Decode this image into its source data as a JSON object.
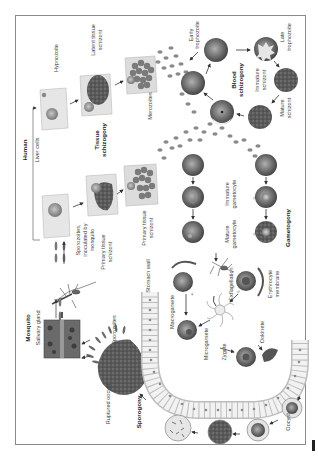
{
  "diagram": {
    "orientation": "rotated 90° counter-clockwise",
    "colors": {
      "frame": "#8a8a8a",
      "cell_dark": "#555555",
      "cell_mid": "#8f8f8f",
      "cell_light": "#cfcfcf",
      "tissue": "#e4e4e4",
      "text": "#444444"
    },
    "sections": {
      "mosquito": "Mosquito",
      "human": "Human"
    },
    "labels": {
      "salivary_gland": "Salivary gland",
      "liver_cells": "Liver cells",
      "hypnozoite": "Hypnozoite",
      "latent_tissue_schizont_1": "Latent tissue",
      "latent_tissue_schizont_2": "schizont",
      "tissue_schizogony_1": "Tissue",
      "tissue_schizogony_2": "schizogony",
      "merozoites": "Merozoites",
      "early_trophozoite_1": "Early",
      "early_trophozoite_2": "trophozoite",
      "late_trophozoite_1": "Late",
      "late_trophozoite_2": "trophozoite",
      "blood_schizogony_1": "Blood",
      "blood_schizogony_2": "schizogony",
      "immature_schizont_1": "Immature",
      "immature_schizont_2": "schizont",
      "mature_schizont_1": "Mature",
      "mature_schizont_2": "schizont",
      "sporozoites_inoculated_1": "Sporozoites,",
      "sporozoites_inoculated_2": "inoculated by",
      "sporozoites_inoculated_3": "mosquito",
      "primary_tissue_schizont_a1": "Primary tissue",
      "primary_tissue_schizont_a2": "schizont",
      "primary_tissue_schizont_b1": "Primary tissue",
      "primary_tissue_schizont_b2": "schizont",
      "sporozoites": "Sporozoites",
      "stomach_wall": "Stomach wall",
      "immature_gametocyte_1": "Immature",
      "immature_gametocyte_2": "gametocyte",
      "mature_gametocyte_1": "Mature",
      "mature_gametocyte_2": "gametocyte",
      "gametogony": "Gametogony",
      "exflagellation": "Exflagellation",
      "erythrocyte_membrane_1": "Erythrocyte",
      "erythrocyte_membrane_2": "membrane",
      "macrogamete": "Macrogamete",
      "microgamete": "Microgamete",
      "zygote": "Zygote",
      "ookinete": "Ookinete",
      "ruptured_oocyst": "Ruptured oocyst",
      "sporogony": "Sporogony",
      "oocyst": "Oocyst",
      "female_symbol": "♀",
      "male_symbol": "♂"
    }
  }
}
